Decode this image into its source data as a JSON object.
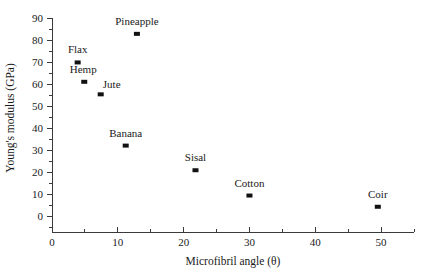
{
  "chart_data": {
    "type": "scatter",
    "title": "",
    "xlabel": "Microfibril angle (θ)",
    "ylabel": "Young's modulus (GPa)",
    "xlim": [
      0,
      55
    ],
    "ylim": [
      0,
      90
    ],
    "x_ticks": [
      0,
      10,
      20,
      30,
      40,
      50
    ],
    "x_tick_labels": [
      "0",
      "10",
      "20",
      "30",
      "40",
      "50"
    ],
    "x_minor_step": 5,
    "y_ticks": [
      0,
      10,
      20,
      30,
      40,
      50,
      60,
      70,
      80,
      90
    ],
    "y_tick_labels": [
      "0",
      "10",
      "20",
      "30",
      "40",
      "50",
      "60",
      "70",
      "80",
      "90"
    ],
    "y_minor_step": 5,
    "grid": false,
    "legend": false,
    "marker_color": "#111111",
    "axis_color": "#3a3a3a",
    "points": [
      {
        "name": "Flax",
        "x": 3.9,
        "y": 69.8,
        "label_dx": 0,
        "label_dy": -9
      },
      {
        "name": "Hemp",
        "x": 4.9,
        "y": 61.0,
        "label_dx": -1,
        "label_dy": -9
      },
      {
        "name": "Jute",
        "x": 7.4,
        "y": 55.3,
        "label_dx": 11,
        "label_dy": -6
      },
      {
        "name": "Banana",
        "x": 11.2,
        "y": 32.0,
        "label_dx": 0,
        "label_dy": -9
      },
      {
        "name": "Pineapple",
        "x": 12.9,
        "y": 82.8,
        "label_dx": 0,
        "label_dy": -9
      },
      {
        "name": "Sisal",
        "x": 21.8,
        "y": 20.8,
        "label_dx": 0,
        "label_dy": -9
      },
      {
        "name": "Cotton",
        "x": 30.0,
        "y": 9.3,
        "label_dx": 0,
        "label_dy": -9
      },
      {
        "name": "Coir",
        "x": 49.5,
        "y": 4.2,
        "label_dx": 0,
        "label_dy": -9
      }
    ]
  },
  "geometry": {
    "plot_left": 52,
    "plot_right": 414,
    "plot_bottom": 216,
    "plot_top": 18,
    "axis_x_end": 414,
    "axis_y_top": 18,
    "x_axis_y": 232,
    "tick_major_len": 5,
    "tick_minor_len": 3,
    "xlabel_pos": {
      "x": 233,
      "y": 265
    },
    "ylabel_pos": {
      "x": 14,
      "y": 118
    }
  }
}
